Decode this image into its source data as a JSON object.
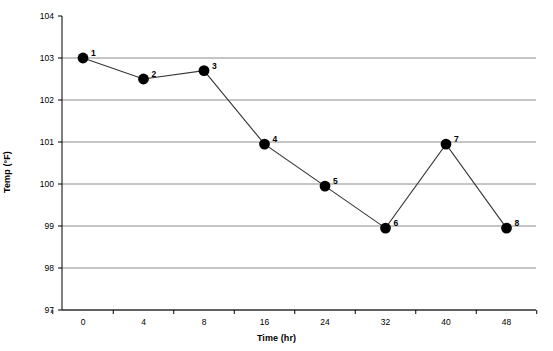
{
  "chart_data": {
    "type": "line",
    "title": "",
    "subtitle": "",
    "xlabel": "Time (hr)",
    "ylabel": "Temp (°F)",
    "categories": [
      "0",
      "4",
      "8",
      "16",
      "24",
      "32",
      "40",
      "48"
    ],
    "x_tick_labels": [
      "0",
      "4",
      "8",
      "16",
      "24",
      "32",
      "40",
      "48"
    ],
    "y_tick_labels": [
      "97",
      "98",
      "99",
      "100",
      "101",
      "102",
      "103",
      "104"
    ],
    "ylim": [
      97,
      104
    ],
    "y_tick_step": 1,
    "grid": "horizontal",
    "legend": "none",
    "marker": "filled-circle",
    "marker_color": "#000000",
    "line_color": "#333333",
    "grid_color": "#808080",
    "axis_color": "#000000",
    "point_labels": [
      "1",
      "2",
      "3",
      "4",
      "5",
      "6",
      "7",
      "8"
    ],
    "series": [
      {
        "name": "Temp",
        "values": [
          103.0,
          102.5,
          102.7,
          100.95,
          99.95,
          98.95,
          100.95,
          98.95
        ]
      }
    ],
    "points": [
      {
        "label": "1",
        "x": "0",
        "y": 103.0
      },
      {
        "label": "2",
        "x": "4",
        "y": 102.5
      },
      {
        "label": "3",
        "x": "8",
        "y": 102.7
      },
      {
        "label": "4",
        "x": "16",
        "y": 100.95
      },
      {
        "label": "5",
        "x": "24",
        "y": 99.95
      },
      {
        "label": "6",
        "x": "32",
        "y": 98.95
      },
      {
        "label": "7",
        "x": "40",
        "y": 100.95
      },
      {
        "label": "8",
        "x": "48",
        "y": 98.95
      }
    ]
  }
}
